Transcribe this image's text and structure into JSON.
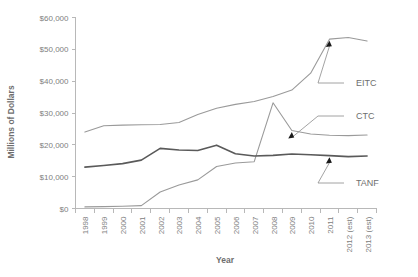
{
  "chart_data": {
    "type": "line",
    "title": "",
    "xlabel": "Year",
    "ylabel": "Millions of Dollars",
    "ylim": [
      0,
      60000
    ],
    "grid": false,
    "legend_position": "inline-annotations",
    "y_ticks": [
      "$0",
      "$10,000",
      "$20,000",
      "$30,000",
      "$40,000",
      "$50,000",
      "$60,000"
    ],
    "y_tick_values": [
      0,
      10000,
      20000,
      30000,
      40000,
      50000,
      60000
    ],
    "categories": [
      "1998",
      "1999",
      "2000",
      "2001",
      "2002",
      "2003",
      "2004",
      "2005",
      "2006",
      "2007",
      "2008",
      "2009",
      "2010",
      "2011",
      "2012 (est)",
      "2013 (est)"
    ],
    "series": [
      {
        "name": "EITC",
        "color": "#9a9a9a",
        "values": [
          24000,
          26000,
          26200,
          26300,
          26400,
          27000,
          29500,
          31500,
          32700,
          33600,
          35200,
          37200,
          42500,
          53200,
          53700,
          52600
        ]
      },
      {
        "name": "CTC",
        "color": "#9a9a9a",
        "values": [
          500,
          600,
          700,
          900,
          5200,
          7400,
          9000,
          13200,
          14300,
          14700,
          33200,
          24500,
          23400,
          23000,
          22900,
          23100
        ]
      },
      {
        "name": "TANF",
        "color": "#5a5a5a",
        "values": [
          13000,
          13500,
          14100,
          15200,
          18900,
          18400,
          18200,
          19900,
          17200,
          16500,
          16700,
          17100,
          16900,
          16600,
          16300,
          16500
        ]
      }
    ],
    "annotations": [
      {
        "label": "EITC",
        "target_series": "EITC",
        "target_category": "2011"
      },
      {
        "label": "CTC",
        "target_series": "CTC",
        "target_category": "2009"
      },
      {
        "label": "TANF",
        "target_series": "TANF",
        "target_category": "2011"
      }
    ]
  },
  "labels": {
    "y_axis_title": "Millions of Dollars",
    "x_axis_title": "Year",
    "eitc": "EITC",
    "ctc": "CTC",
    "tanf": "TANF"
  },
  "colors": {
    "axis": "#b8b8b8",
    "tick_text": "#808080",
    "series_light": "#9a9a9a",
    "series_dark": "#5a5a5a",
    "background": "#ffffff"
  }
}
